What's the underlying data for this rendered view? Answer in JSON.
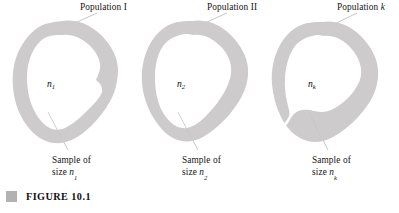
{
  "figure": {
    "caption_marker": "gray-square-marker",
    "caption": "FIGURE 10.1",
    "blob_fill_color": "#cccaca",
    "leader_line_color": "#b8b8b8",
    "background_color": "#ffffff"
  },
  "panels": [
    {
      "id": "panel-1",
      "population_label": "Population I",
      "population_label_plain": "Population",
      "population_label_index": "I",
      "inner_label": "n",
      "inner_label_sub": "1",
      "sample_line1": "Sample of",
      "sample_line2_prefix": "size ",
      "sample_line2_symbol": "n",
      "sample_line2_sub": "1"
    },
    {
      "id": "panel-2",
      "population_label": "Population II",
      "population_label_plain": "Population",
      "population_label_index": "II",
      "inner_label": "n",
      "inner_label_sub": "2",
      "sample_line1": "Sample of",
      "sample_line2_prefix": "size ",
      "sample_line2_symbol": "n",
      "sample_line2_sub": "2"
    },
    {
      "id": "panel-3",
      "population_label": "Population k",
      "population_label_plain": "Population",
      "population_label_index": "k",
      "inner_label": "n",
      "inner_label_sub": "k",
      "sample_line1": "Sample of",
      "sample_line2_prefix": "size ",
      "sample_line2_symbol": "n",
      "sample_line2_sub": "k"
    }
  ]
}
